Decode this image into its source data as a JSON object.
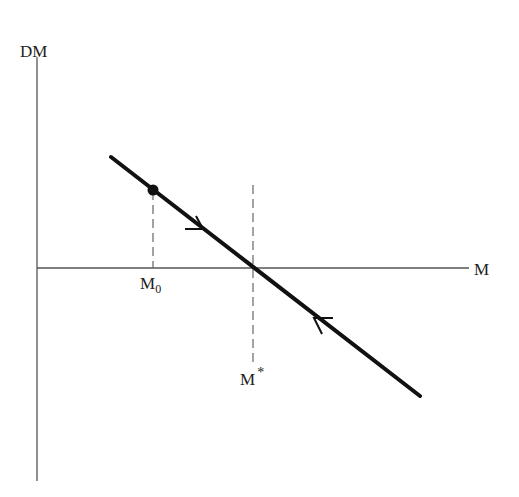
{
  "diagram": {
    "type": "phase-diagram",
    "axes": {
      "y_label": "DM",
      "x_label": "M"
    },
    "markers": {
      "initial_point_label": "M",
      "initial_point_subscript": "0",
      "equilibrium_label": "M",
      "equilibrium_superscript": "*"
    },
    "line": {
      "description": "downward-sloping line crossing M-axis at M*",
      "arrows": [
        "toward M* from left (above axis)",
        "toward M* from right (below axis)"
      ]
    },
    "colors": {
      "line": "#111111",
      "axis": "#555555",
      "dashed": "#666666",
      "text": "#222222"
    }
  }
}
